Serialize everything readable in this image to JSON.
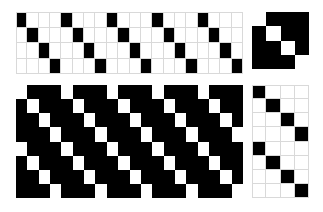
{
  "figure": {
    "title": "",
    "background_color": "#ffffff",
    "on_color": "#000000",
    "off_color": "#ffffff",
    "gridline_color": "#d9d9d9"
  },
  "panels": [
    {
      "name": "top-left",
      "label": "",
      "columns": 20,
      "rows": 4,
      "style": "light",
      "description": "white grid with black diagonal stripes, period 4",
      "cells": [
        [
          1,
          0,
          0,
          0,
          1,
          0,
          0,
          0,
          1,
          0,
          0,
          0,
          1,
          0,
          0,
          0,
          1,
          0,
          0,
          0
        ],
        [
          0,
          1,
          0,
          0,
          0,
          1,
          0,
          0,
          0,
          1,
          0,
          0,
          0,
          1,
          0,
          0,
          0,
          1,
          0,
          0
        ],
        [
          0,
          0,
          1,
          0,
          0,
          0,
          1,
          0,
          0,
          0,
          1,
          0,
          0,
          0,
          1,
          0,
          0,
          0,
          1,
          0
        ],
        [
          0,
          0,
          0,
          1,
          0,
          0,
          0,
          1,
          0,
          0,
          0,
          1,
          0,
          0,
          0,
          1,
          0,
          0,
          0,
          1
        ]
      ]
    },
    {
      "name": "top-right",
      "label": "",
      "columns": 4,
      "rows": 4,
      "style": "dark",
      "description": "black square with white main diagonal",
      "cells": [
        [
          0,
          1,
          1,
          1
        ],
        [
          1,
          0,
          1,
          1
        ],
        [
          1,
          1,
          0,
          1
        ],
        [
          1,
          1,
          1,
          0
        ]
      ]
    },
    {
      "name": "bottom-left",
      "label": "",
      "columns": 20,
      "rows": 8,
      "style": "dark",
      "description": "black field with white diagonal stripes, period 4",
      "cells": [
        [
          0,
          1,
          1,
          1,
          0,
          1,
          1,
          1,
          0,
          1,
          1,
          1,
          0,
          1,
          1,
          1,
          0,
          1,
          1,
          1
        ],
        [
          1,
          0,
          1,
          1,
          1,
          0,
          1,
          1,
          1,
          0,
          1,
          1,
          1,
          0,
          1,
          1,
          1,
          0,
          1,
          1
        ],
        [
          1,
          1,
          0,
          1,
          1,
          1,
          0,
          1,
          1,
          1,
          0,
          1,
          1,
          1,
          0,
          1,
          1,
          1,
          0,
          1
        ],
        [
          1,
          1,
          1,
          0,
          1,
          1,
          1,
          0,
          1,
          1,
          1,
          0,
          1,
          1,
          1,
          0,
          1,
          1,
          1,
          0
        ],
        [
          0,
          1,
          1,
          1,
          0,
          1,
          1,
          1,
          0,
          1,
          1,
          1,
          0,
          1,
          1,
          1,
          0,
          1,
          1,
          1
        ],
        [
          1,
          0,
          1,
          1,
          1,
          0,
          1,
          1,
          1,
          0,
          1,
          1,
          1,
          0,
          1,
          1,
          1,
          0,
          1,
          1
        ],
        [
          1,
          1,
          0,
          1,
          1,
          1,
          0,
          1,
          1,
          1,
          0,
          1,
          1,
          1,
          0,
          1,
          1,
          1,
          0,
          1
        ],
        [
          1,
          1,
          1,
          0,
          1,
          1,
          1,
          0,
          1,
          1,
          1,
          0,
          1,
          1,
          1,
          0,
          1,
          1,
          1,
          0
        ]
      ]
    },
    {
      "name": "bottom-right",
      "label": "",
      "columns": 4,
      "rows": 8,
      "style": "light",
      "description": "white grid with repeating black diagonal, period 4",
      "cells": [
        [
          1,
          0,
          0,
          0
        ],
        [
          0,
          1,
          0,
          0
        ],
        [
          0,
          0,
          1,
          0
        ],
        [
          0,
          0,
          0,
          1
        ],
        [
          1,
          0,
          0,
          0
        ],
        [
          0,
          1,
          0,
          0
        ],
        [
          0,
          0,
          1,
          0
        ],
        [
          0,
          0,
          0,
          1
        ]
      ]
    }
  ]
}
